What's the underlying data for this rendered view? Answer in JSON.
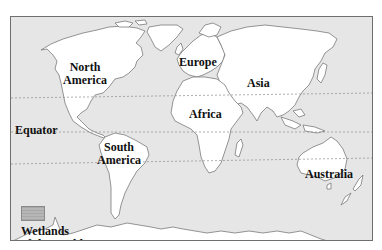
{
  "map": {
    "title": "Wetlands of the world",
    "colors": {
      "ocean": "#e6e6e6",
      "land": "#ffffff",
      "coastline": "#7a7a7a",
      "frame": "#6f6f6f",
      "wetlands_swatch": "#b0b0b0",
      "label_text": "#111111"
    },
    "continents": [
      {
        "id": "north-america",
        "line1": "North",
        "line2": "America"
      },
      {
        "id": "south-america",
        "line1": "South",
        "line2": "America"
      },
      {
        "id": "europe",
        "label": "Europe"
      },
      {
        "id": "asia",
        "label": "Asia"
      },
      {
        "id": "africa",
        "label": "Africa"
      },
      {
        "id": "australia",
        "label": "Australia"
      }
    ],
    "reference_lines": {
      "equator": "Equator"
    },
    "legend": {
      "line1": "Wetlands",
      "line2": "of the world"
    }
  }
}
